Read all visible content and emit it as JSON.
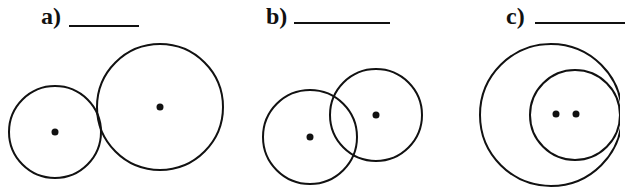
{
  "panels": [
    {
      "label": "a)",
      "blank": "",
      "relation": "externally tangent circles"
    },
    {
      "label": "b)",
      "blank": "",
      "relation": "intersecting circles"
    },
    {
      "label": "c)",
      "blank": "",
      "relation": "internally nested circles"
    }
  ],
  "figures": {
    "a": {
      "circles": [
        {
          "cx": 55,
          "cy": 132,
          "r": 46
        },
        {
          "cx": 160,
          "cy": 107,
          "r": 63
        }
      ]
    },
    "b": {
      "circles": [
        {
          "cx": 310,
          "cy": 137,
          "r": 47
        },
        {
          "cx": 376,
          "cy": 115,
          "r": 46
        }
      ]
    },
    "c": {
      "circles": [
        {
          "cx": 551,
          "cy": 115,
          "r": 71
        },
        {
          "cx": 575,
          "cy": 115,
          "r": 45
        }
      ],
      "dots": [
        {
          "x": 556,
          "y": 114
        },
        {
          "x": 576,
          "y": 114
        }
      ]
    }
  },
  "colors": {
    "stroke": "#111111",
    "background": "#ffffff"
  }
}
